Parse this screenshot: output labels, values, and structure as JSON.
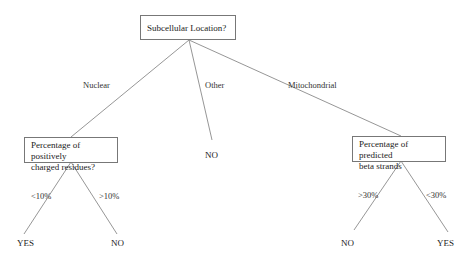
{
  "diagram": {
    "type": "decision-tree",
    "root": {
      "question": "Subcellular Location?",
      "branches": [
        {
          "label": "Nuclear",
          "child": {
            "question": "Percentage of positively charged residues?",
            "question_lines": [
              "Percentage of positively",
              "charged residues?"
            ],
            "branches": [
              {
                "label": "<10%",
                "leaf": "YES"
              },
              {
                "label": ">10%",
                "leaf": "NO"
              }
            ]
          }
        },
        {
          "label": "Other",
          "leaf": "NO"
        },
        {
          "label": "Mitochondrial",
          "child": {
            "question": "Percentage of predicted beta strands",
            "question_lines": [
              "Percentage of predicted",
              "beta strands"
            ],
            "branches": [
              {
                "label": ">30%",
                "leaf": "NO"
              },
              {
                "label": "<30%",
                "leaf": "YES"
              }
            ]
          }
        }
      ]
    }
  },
  "colors": {
    "line": "#8a8a8a",
    "border": "#777777",
    "text": "#222222",
    "background": "#ffffff"
  }
}
